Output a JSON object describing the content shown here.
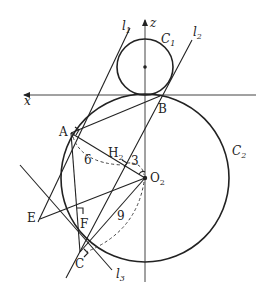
{
  "diagram": {
    "axes": {
      "x_label": "x",
      "z_label": "z"
    },
    "circles": [
      {
        "name": "C",
        "sub": "1",
        "center": [
          145,
          67
        ],
        "radius": 28
      },
      {
        "name": "C",
        "sub": "2",
        "center": [
          145,
          178
        ],
        "radius": 84
      }
    ],
    "lines": [
      {
        "name": "l",
        "sub": "1"
      },
      {
        "name": "l",
        "sub": "2"
      },
      {
        "name": "l",
        "sub": "3"
      }
    ],
    "points": {
      "A": "A",
      "B": "B",
      "C": "C",
      "E": "E",
      "F": "F",
      "H2": "H",
      "H2_sub": "2",
      "O2": "O",
      "O2_sub": "2"
    },
    "measures": {
      "AH2": "6",
      "H2O2": "3",
      "CO2": "9"
    }
  }
}
